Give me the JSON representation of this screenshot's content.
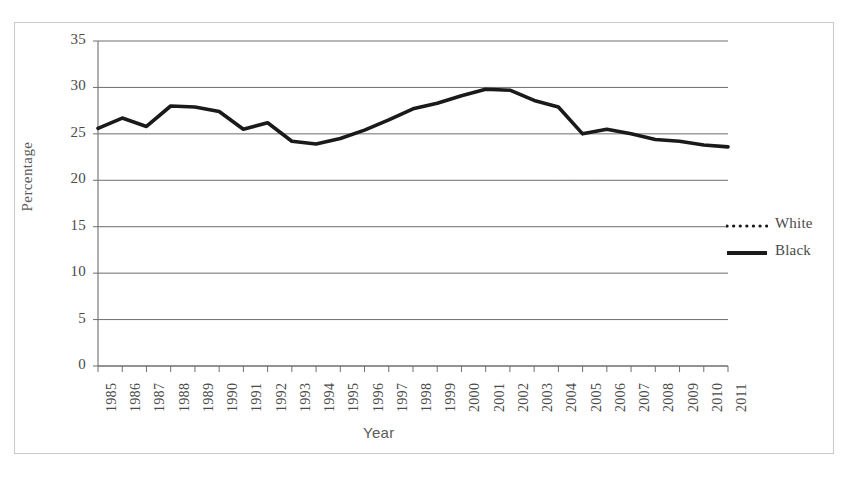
{
  "figure": {
    "y_axis_title": "Percentage",
    "x_axis_title": "Year"
  },
  "legend": {
    "position": "right",
    "entries": [
      {
        "label": "White",
        "style": "dotted",
        "color": "#1a1a1a"
      },
      {
        "label": "Black",
        "style": "solid",
        "color": "#1a1a1a"
      }
    ]
  },
  "chart_data": {
    "type": "line",
    "title": "",
    "subtitle": "",
    "xlabel": "Year",
    "ylabel": "Percentage",
    "xlim": [
      1985,
      2011
    ],
    "ylim": [
      0,
      35
    ],
    "ytick_values": [
      0,
      5,
      10,
      15,
      20,
      25,
      30,
      35
    ],
    "ytick_labels": [
      "0",
      "5",
      "10",
      "15",
      "20",
      "25",
      "30",
      "35"
    ],
    "grid": "horizontal",
    "legend_position": "right",
    "categories": [
      "1985",
      "1986",
      "1987",
      "1988",
      "1989",
      "1990",
      "1991",
      "1992",
      "1993",
      "1994",
      "1995",
      "1996",
      "1997",
      "1998",
      "1999",
      "2000",
      "2001",
      "2002",
      "2003",
      "2004",
      "2005",
      "2006",
      "2007",
      "2008",
      "2009",
      "2010",
      "2011"
    ],
    "x": [
      1985,
      1986,
      1987,
      1988,
      1989,
      1990,
      1991,
      1992,
      1993,
      1994,
      1995,
      1996,
      1997,
      1998,
      1999,
      2000,
      2001,
      2002,
      2003,
      2004,
      2005,
      2006,
      2007,
      2008,
      2009,
      2010,
      2011
    ],
    "series": [
      {
        "name": "White",
        "style": "dotted",
        "color": "#1a1a1a",
        "values": [
          17.3,
          17.4,
          16.1,
          16.3,
          17.1,
          17.2,
          13.7,
          14.9,
          15.5,
          15.5,
          15.3,
          15.2,
          17.5,
          19.3,
          19.6,
          19.9,
          20.9,
          21.3,
          21.2,
          20.3,
          20.2,
          20.4,
          19.5,
          18.8,
          18.9,
          19.5,
          19.4
        ]
      },
      {
        "name": "Black",
        "style": "solid",
        "color": "#1a1a1a",
        "values": [
          25.6,
          26.7,
          25.8,
          28.0,
          27.9,
          27.4,
          25.5,
          26.2,
          24.2,
          23.9,
          24.5,
          25.4,
          26.5,
          27.7,
          28.3,
          29.1,
          29.8,
          29.7,
          28.6,
          27.9,
          25.0,
          25.5,
          25.0,
          24.4,
          24.2,
          23.8,
          23.6
        ]
      }
    ]
  }
}
